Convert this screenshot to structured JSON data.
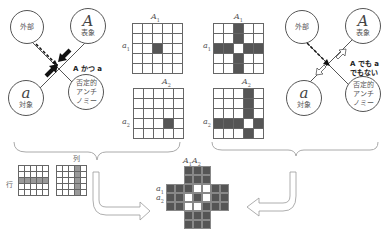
{
  "left_diagram": {
    "circles": [
      {
        "id": "outside",
        "text": "外部"
      },
      {
        "id": "representation",
        "symbol": "A",
        "text": "表象"
      },
      {
        "id": "object",
        "symbol": "a",
        "text": "対象"
      },
      {
        "id": "antinomy",
        "text": "否定的\nアンチ\nノミー",
        "lines": [
          "否定的",
          "アンチ",
          "ノミー"
        ]
      }
    ],
    "caption": "A かつ a"
  },
  "right_diagram": {
    "circles": [
      {
        "id": "outside",
        "text": "外部"
      },
      {
        "id": "representation",
        "symbol": "A",
        "text": "表象"
      },
      {
        "id": "object",
        "symbol": "a",
        "text": "対象"
      },
      {
        "id": "antinomy",
        "lines": [
          "否定的",
          "アンチ",
          "ノミー"
        ]
      }
    ],
    "caption_lines": [
      "A でも a",
      "でもない"
    ]
  },
  "grids": {
    "g1": {
      "col_label": "A1",
      "row_label": "a1",
      "size": 5,
      "filled": [
        [
          2,
          2
        ]
      ]
    },
    "g2": {
      "col_label": "A2",
      "row_label": "a2",
      "size": 5,
      "filled": [
        [
          3,
          3
        ]
      ]
    },
    "g3": {
      "col_label": "A1",
      "row_label": "a1",
      "size": 5,
      "filled": "cross_at_2_2_except_center"
    },
    "g4": {
      "col_label": "A2",
      "row_label": "a2",
      "size": 5,
      "filled": "cross_at_3_3_except_center"
    },
    "row_example": {
      "label": "行"
    },
    "col_example": {
      "label": "列"
    },
    "combined": {
      "col_label": "A1 A2",
      "row_labels": [
        "a1",
        "a2"
      ],
      "size": 7
    }
  },
  "labels": {
    "A": "A",
    "a": "a",
    "s1": "1",
    "s2": "2",
    "row": "行",
    "col": "列",
    "left_caption": "A かつ a",
    "right_caption_1": "A でも a",
    "right_caption_2": "でもない",
    "outside": "外部",
    "repr": "表象",
    "obj": "対象",
    "ant1": "否定的",
    "ant2": "アンチ",
    "ant3": "ノミー"
  }
}
